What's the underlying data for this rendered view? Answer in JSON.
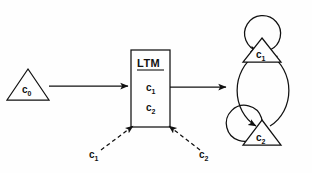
{
  "figure": {
    "type": "state-transition-diagram",
    "background_color": "#fefefe",
    "stroke_color": "#111111"
  },
  "nodes": {
    "source_triangle": {
      "label": "c",
      "subscript": "0",
      "shape": "triangle",
      "x": 28,
      "y": 85
    },
    "ltm_box": {
      "title": "LTM",
      "title_underlined": true,
      "shape": "rectangle",
      "items": [
        {
          "label": "c",
          "subscript": "1"
        },
        {
          "label": "c",
          "subscript": "2"
        }
      ]
    },
    "state_c1": {
      "label": "c",
      "subscript": "1",
      "shape": "triangle",
      "position": "top"
    },
    "state_c2": {
      "label": "c",
      "subscript": "2",
      "shape": "triangle",
      "position": "bottom"
    }
  },
  "edges": {
    "source_to_ltm": {
      "style": "solid",
      "arrow": "end"
    },
    "ltm_to_cycle": {
      "style": "solid",
      "arrow": "end"
    },
    "dashed_input_left": {
      "style": "dashed",
      "arrow": "end",
      "label": "c",
      "subscript": "1"
    },
    "dashed_input_right": {
      "style": "dashed",
      "arrow": "end",
      "label": "c",
      "subscript": "2"
    },
    "cycle_left": {
      "style": "solid",
      "arrow": "end"
    },
    "cycle_right": {
      "style": "solid",
      "arrow": "end"
    },
    "self_loop_c1": {
      "style": "solid",
      "arrow": "end"
    },
    "self_loop_c2": {
      "style": "solid",
      "arrow": "end"
    }
  }
}
